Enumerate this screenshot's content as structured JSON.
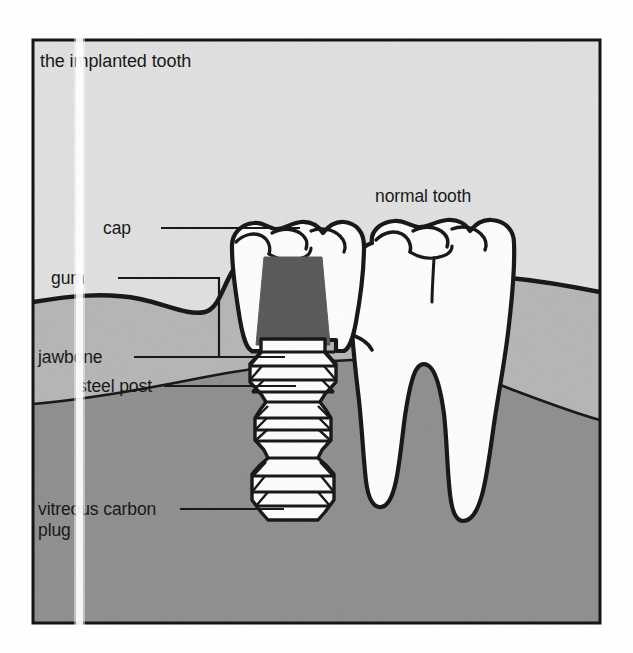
{
  "figure": {
    "title": "the implanted tooth",
    "kind": "dental-implant-cross-section-diagram",
    "colors": {
      "paper": "#ffffff",
      "background_tissue": "#e0e0e0",
      "gum": "#b5b5b5",
      "jawbone": "#8e8e8e",
      "tooth_white": "#fdfdfd",
      "steel_post": "#58585a",
      "ink": "#141414"
    },
    "frame": {
      "border_color": "#141414",
      "border_width_px": 3
    },
    "labels": [
      {
        "id": "title",
        "text": "the implanted tooth",
        "leader": false
      },
      {
        "id": "cap",
        "text": "cap",
        "leader": true
      },
      {
        "id": "gum",
        "text": "gum",
        "leader": true
      },
      {
        "id": "jawbone",
        "text": "jawbone",
        "leader": true
      },
      {
        "id": "steel-post",
        "text": "steel post",
        "leader": true
      },
      {
        "id": "vitreous-1",
        "text": "vitreous carbon",
        "leader": true
      },
      {
        "id": "vitreous-2",
        "text": "plug",
        "leader": false
      },
      {
        "id": "normal-tooth",
        "text": "normal tooth",
        "leader": false
      }
    ],
    "parts": {
      "implanted_tooth": "implanted tooth with crown cap, steel post and threaded vitreous carbon plug",
      "normal_tooth": "normal two-rooted molar",
      "layers": [
        "gum",
        "jawbone"
      ]
    },
    "artifacts": {
      "scan_line": "vertical white photocopy streak"
    }
  }
}
